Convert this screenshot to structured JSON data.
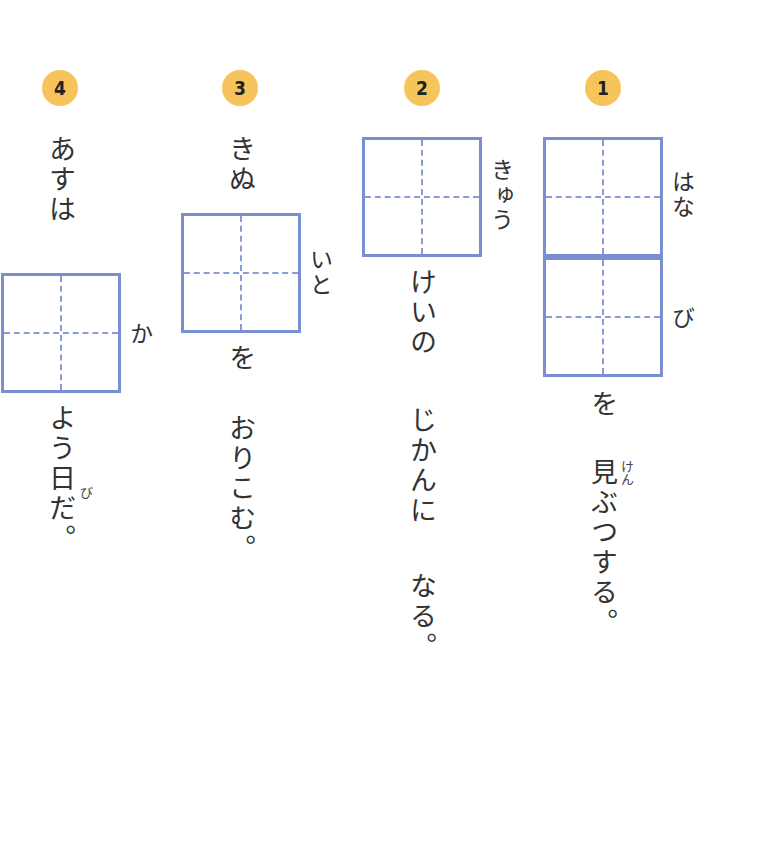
{
  "problems": [
    {
      "number": "1",
      "box_reading": [
        "は",
        "な",
        "び"
      ],
      "box_reading_top": "はな",
      "box_reading_bottom": "び",
      "after_box": "を",
      "rest": "見ぶつする。",
      "kanji_ruby": "けん"
    },
    {
      "number": "2",
      "box_reading": "きゅう",
      "after_box": "けいの",
      "rest_1": "じかんに",
      "rest_2": "なる。"
    },
    {
      "number": "3",
      "before_box": "きぬ",
      "box_reading": "いと",
      "after_box": "を",
      "rest": "おりこむ。"
    },
    {
      "number": "4",
      "before_box": "あすは",
      "box_reading": "か",
      "after_box": "よう日だ。",
      "kanji_ruby": "び"
    }
  ],
  "colors": {
    "badge": "#f6c45a",
    "box_border": "#7b8fd0",
    "guide_line": "#8a9bd8",
    "text": "#333333"
  }
}
